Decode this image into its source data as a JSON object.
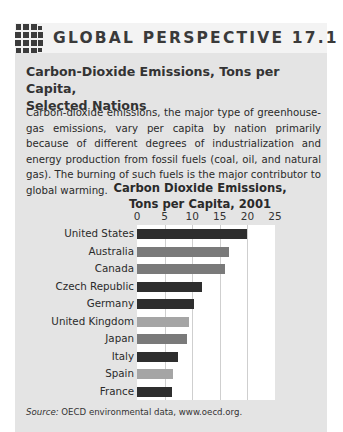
{
  "header": {
    "icon": "globe-icon",
    "title": "GLOBAL PERSPECTIVE 17.1"
  },
  "subtitle_line1": "Carbon-Dioxide Emissions, Tons per Capita,",
  "subtitle_line2": "Selected Nations",
  "body": "Carbon-dioxide emissions, the major type of greenhouse-gas emissions, vary per capita by nation primarily because of different degrees of industrialization and energy production from fossil fuels (coal, oil, and natural gas). The burning of such fuels is the major contributor to global warming.",
  "source_label": "Source:",
  "source_text": " OECD environmental data, www.oecd.org.",
  "colors": {
    "dark": "#2e2e2e",
    "medium": "#7a7a7a",
    "light": "#a5a5a5",
    "panel": "#e4e4e4"
  },
  "chart_data": {
    "type": "bar",
    "orientation": "horizontal",
    "title": "Carbon Dioxide Emissions, Tons per Capita, 2001",
    "title_line1": "Carbon Dioxide Emissions,",
    "title_line2": "Tons per Capita, 2001",
    "xlabel": "",
    "ylabel": "",
    "xlim": [
      0,
      25
    ],
    "xticks": [
      "0",
      "5",
      "10",
      "15",
      "20",
      "25"
    ],
    "axis_position": "top",
    "grid": true,
    "legend": null,
    "categories": [
      "United States",
      "Australia",
      "Canada",
      "Czech Republic",
      "Germany",
      "United Kingdom",
      "Japan",
      "Italy",
      "Spain",
      "France"
    ],
    "values": [
      20.0,
      16.6,
      15.9,
      11.7,
      10.4,
      9.4,
      9.0,
      7.4,
      6.5,
      6.4
    ],
    "bar_shades": [
      "dark",
      "medium",
      "medium",
      "dark",
      "dark",
      "light",
      "medium",
      "dark",
      "light",
      "dark"
    ]
  }
}
